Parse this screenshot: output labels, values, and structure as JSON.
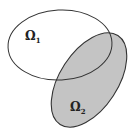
{
  "diagram": {
    "type": "venn-sets",
    "background": "#ffffff",
    "sets": [
      {
        "id": "omega1",
        "label": "Ω",
        "subscript": "1",
        "fill": "none",
        "stroke": "#333333"
      },
      {
        "id": "omega2",
        "label": "Ω",
        "subscript": "2",
        "fill": "#c4c4c4",
        "stroke": "#333333"
      }
    ]
  }
}
